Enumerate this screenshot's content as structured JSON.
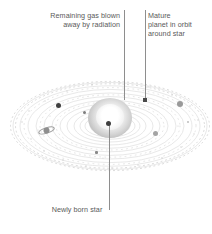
{
  "figure": {
    "type": "astronomy-diagram",
    "background_color": "#ffffff"
  },
  "labels": {
    "gas": {
      "text": "Remaining gas blown\naway by radiation",
      "name": "annotation-remaining-gas"
    },
    "planet": {
      "text": "Mature\nplanet in orbit\naround star",
      "name": "annotation-mature-planet"
    },
    "star": {
      "text": "Newly born star",
      "name": "annotation-newly-born-star"
    }
  },
  "colors": {
    "text": "#5a5a5a",
    "leader_line": "#8e8e8e",
    "orbit_ring": "#d6d6d6",
    "dust_speck": "#cfcfcf",
    "planet_dark": "#3f3f3f",
    "planet_gray": "#9a9a9a",
    "star_core": "#ffffff",
    "star_halo": "#b6b6b6"
  },
  "scene": {
    "disk": {
      "name": "protoplanetary-disk",
      "center_x": 110,
      "center_y": 126,
      "orbit_count": 12,
      "outer_rx": 98,
      "outer_ry": 44,
      "inner_rx": 26,
      "inner_ry": 11
    },
    "star": {
      "name": "central-star",
      "center_x": 110,
      "center_y": 118,
      "radius_x": 22,
      "radius_y": 20
    },
    "planets": [
      {
        "name": "planet-dark-left",
        "x": 58,
        "y": 106,
        "size": 5,
        "color": "#3f3f3f",
        "shape": "circle"
      },
      {
        "name": "planet-small-upper",
        "x": 84,
        "y": 112,
        "size": 3,
        "color": "#7d7d7d",
        "shape": "circle"
      },
      {
        "name": "planet-dark-leader",
        "x": 145,
        "y": 100,
        "size": 4,
        "color": "#4a4a4a",
        "shape": "square"
      },
      {
        "name": "planet-gray-right",
        "x": 180,
        "y": 104,
        "size": 6,
        "color": "#9a9a9a",
        "shape": "circle"
      },
      {
        "name": "planet-gray-lower",
        "x": 155,
        "y": 133,
        "size": 5,
        "color": "#a4a4a4",
        "shape": "circle"
      },
      {
        "name": "planet-small-lower",
        "x": 96,
        "y": 152,
        "size": 3,
        "color": "#8a8a8a",
        "shape": "square"
      },
      {
        "name": "planet-speck-right",
        "x": 188,
        "y": 122,
        "size": 2,
        "color": "#bdbdbd",
        "shape": "circle"
      },
      {
        "name": "planet-ringed-left",
        "x": 46,
        "y": 128,
        "size": 7,
        "color": "#8e8e8e",
        "shape": "ringed"
      }
    ]
  }
}
